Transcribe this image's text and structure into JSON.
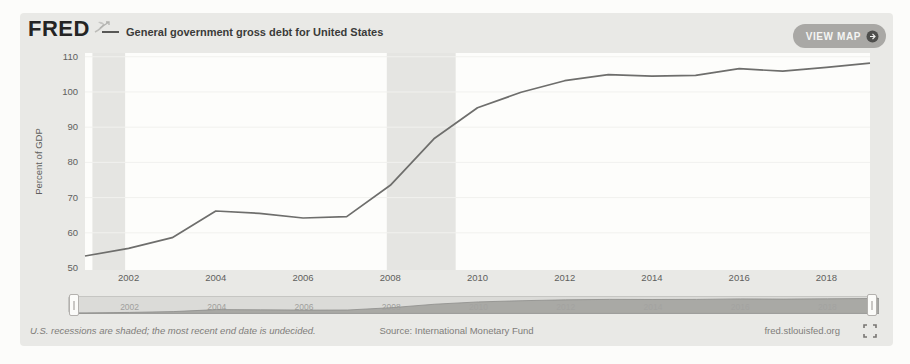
{
  "page": {
    "background": "#fcfcfa",
    "card_background": "#e9e9e6"
  },
  "header": {
    "logo_text": "FRED",
    "logo_icon": "fred-sprout-icon",
    "series_title": "General government gross debt for United States",
    "view_map": {
      "label": "VIEW MAP",
      "icon": "globe-arrow-icon"
    }
  },
  "chart_data": {
    "type": "line",
    "title": "General government gross debt for United States",
    "xlabel": "",
    "ylabel": "Percent of GDP",
    "x": [
      2001,
      2002,
      2003,
      2004,
      2005,
      2006,
      2007,
      2008,
      2009,
      2010,
      2011,
      2012,
      2013,
      2014,
      2015,
      2016,
      2017,
      2018,
      2019
    ],
    "values": [
      53.4,
      55.6,
      58.6,
      66.2,
      65.5,
      64.2,
      64.6,
      73.5,
      86.7,
      95.5,
      99.9,
      103.2,
      104.9,
      104.5,
      104.7,
      106.6,
      105.9,
      107.0,
      108.2
    ],
    "series_name": "General government gross debt for United States",
    "xlim": [
      2001,
      2019
    ],
    "ylim": [
      50,
      110
    ],
    "yticks": [
      50,
      60,
      70,
      80,
      90,
      100,
      110
    ],
    "xticks": [
      2002,
      2004,
      2006,
      2008,
      2010,
      2012,
      2014,
      2016,
      2018
    ],
    "recession_bands": [
      [
        2001.17,
        2001.92
      ],
      [
        2007.92,
        2009.5
      ]
    ],
    "grid": "faint-horizontal",
    "legend_position": "top-left",
    "colors": {
      "line": "#6e6e6c",
      "plot_background": "#fdfdfb",
      "recession_band": "#e5e5e2",
      "gridline": "#f1f1ee",
      "tick_text": "#5f5f5d"
    }
  },
  "slider": {
    "labels": [
      "2002",
      "2004",
      "2006",
      "2008",
      "2010",
      "2012",
      "2014",
      "2016",
      "2018"
    ],
    "track_color": "#dbdbd8",
    "area_color": "#a3a3a0",
    "label_color": "#6f6f6d",
    "handles": [
      "left",
      "right"
    ]
  },
  "footer": {
    "recession_note": "U.S. recessions are shaded; the most recent end date is undecided.",
    "source": "Source: International Monetary Fund",
    "site_link": "fred.stlouisfed.org",
    "fullscreen_icon": "fullscreen-icon"
  }
}
